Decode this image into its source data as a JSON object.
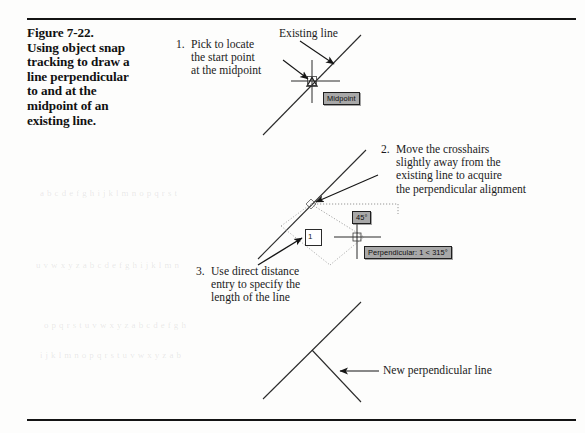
{
  "page": {
    "background_color": "#fdfdfc",
    "rule_color": "#141414",
    "figure_number": "Figure 7-22."
  },
  "caption": {
    "lines": [
      "Figure 7-22.",
      "Using object snap",
      "tracking to draw a",
      "line perpendicular",
      "to and at the",
      "midpoint of an",
      "existing line."
    ],
    "text": "Figure 7-22. Using object snap tracking to draw a line perpendicular to and at the midpoint of an existing line."
  },
  "steps": [
    {
      "number": "1.",
      "lines": [
        "Pick to locate",
        "the start point",
        "at the midpoint"
      ],
      "text": "Pick to locate the start point at the midpoint"
    },
    {
      "number": "2.",
      "lines": [
        "Move the crosshairs",
        "slightly away from the",
        "existing line to acquire",
        "the perpendicular alignment"
      ],
      "text": "Move the crosshairs slightly away from the existing line to acquire the perpendicular alignment"
    },
    {
      "number": "3.",
      "lines": [
        "Use direct distance",
        "entry to specify the",
        "length of the line"
      ],
      "text": "Use direct distance entry to specify the length of the line"
    }
  ],
  "labels": {
    "existing_line": "Existing line",
    "new_perpendicular_line": "New perpendicular line"
  },
  "tooltips": {
    "midpoint": "Midpoint",
    "angle": "45°",
    "perpendicular": "Perpendicular: 1 < 315°",
    "background_color": "#a8a8a8",
    "border_color": "#1f1f1f"
  },
  "direct_distance_entry": {
    "value": "1",
    "name": "direct-distance-entry-box"
  },
  "bleed_through_text": [
    "a b c d e f g h i j k l m n o p q r s t",
    "u v w x y z a b c d e f g h i j k l m n",
    "o p q r s t u v w x y z a b c d e f g h",
    "i j k l m n o p q r s t u v w x y z a b"
  ]
}
